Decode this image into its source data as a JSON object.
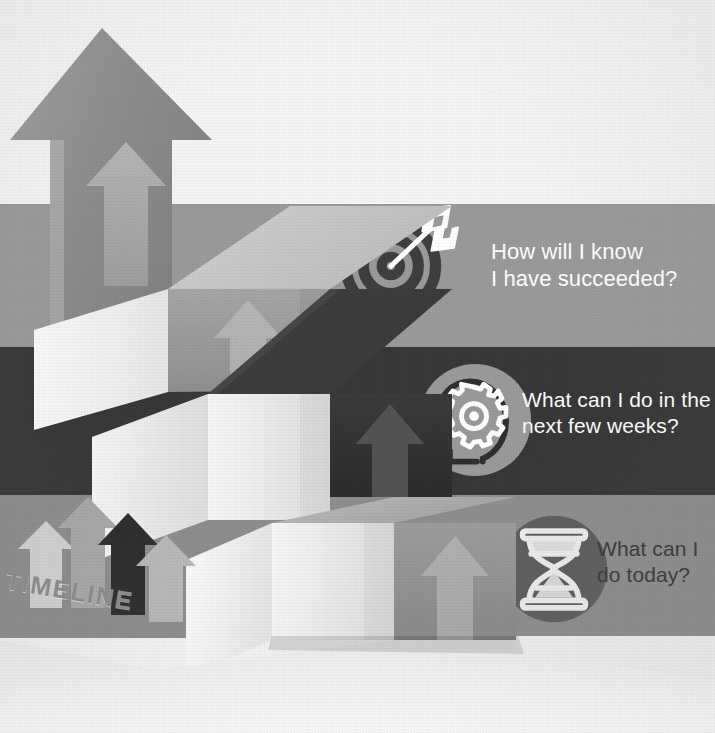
{
  "canvas": {
    "width": 715,
    "height": 733,
    "background": "#f4f4f2"
  },
  "title_label": "TIMELINE",
  "bands": [
    {
      "id": "band-top",
      "question": "How will I know\nI have succeeded?",
      "icon": "target-dartboard-icon",
      "background": "#9a9a9a",
      "text_color": "#ffffff",
      "icon_color": "#3f3f3f",
      "top": 204,
      "height": 143,
      "text_left": 491,
      "text_top": 239,
      "font_size": 22,
      "icon_left": 338,
      "icon_top": 203,
      "icon_size": 122
    },
    {
      "id": "band-middle",
      "question": "What can I do in the\nnext few weeks?",
      "icon": "head-with-gear-icon",
      "background": "#383838",
      "text_color": "#ffffff",
      "icon_color": "#9a9a9a",
      "top": 347,
      "height": 148,
      "text_left": 522,
      "text_top": 387,
      "font_size": 21,
      "icon_left": 417,
      "icon_top": 362,
      "icon_size": 116
    },
    {
      "id": "band-bottom",
      "question": "What can I\ndo today?",
      "icon": "hourglass-icon",
      "background": "#8e8e8e",
      "text_color": "#3a3a3a",
      "icon_color": "#5f5f5f",
      "top": 495,
      "height": 143,
      "text_left": 597,
      "text_top": 536,
      "font_size": 21,
      "icon_left": 497,
      "icon_top": 512,
      "icon_size": 114
    }
  ],
  "staircase": {
    "description": "Isometric three-dimensional staircase of four ascending blocks rendered in greyscale",
    "steps": [
      {
        "name": "step-1-top",
        "top_face": "#c9c9c9",
        "front_face": "#9d9d9d",
        "side_face": "#e8e8e8",
        "embossed_arrow": "up-arrow"
      },
      {
        "name": "step-2",
        "top_face": "#3d3d3d",
        "front_face": "#333333",
        "side_face": "#e2e2e2",
        "embossed_arrow": "up-arrow"
      },
      {
        "name": "step-3",
        "top_face": "#adadad",
        "front_face": "#949494",
        "side_face": "#efefef",
        "embossed_arrow": "up-arrow"
      },
      {
        "name": "step-4-bottom",
        "top_face": "#d4d4d4",
        "front_face": "#a8a8a8",
        "side_face": "#f2f2f2",
        "embossed_arrow": "up-arrow"
      }
    ]
  },
  "big_arrow": {
    "name": "big-up-arrow",
    "fill": "#8f8f8f",
    "inner_arrow_fill": "#b4b4b4"
  },
  "mini_arrows": [
    {
      "name": "mini-arrow-1",
      "fill": "#d2d2d2"
    },
    {
      "name": "mini-arrow-2",
      "fill": "#a9a9a9"
    },
    {
      "name": "mini-arrow-3",
      "fill": "#2e2e2e"
    },
    {
      "name": "mini-arrow-4",
      "fill": "#b9b9b9"
    }
  ],
  "palette": {
    "background": "#f4f4f2",
    "light_gray": "#c9c9c9",
    "mid_gray": "#9a9a9a",
    "dark_gray": "#383838",
    "near_black": "#2e2e2e",
    "white": "#ffffff"
  }
}
